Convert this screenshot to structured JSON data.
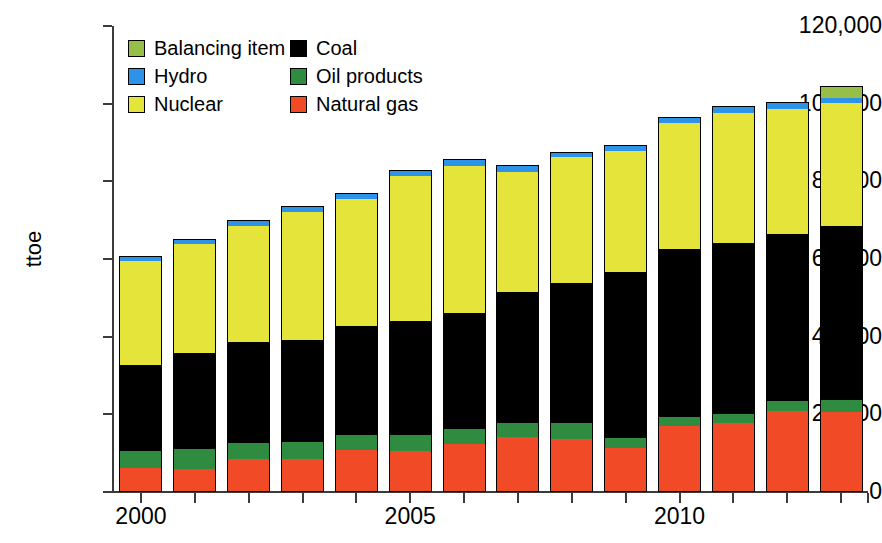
{
  "chart_data": {
    "type": "bar",
    "stacked": true,
    "title": "",
    "xlabel": "",
    "ylabel": "ttoe",
    "ylim": [
      0,
      120000
    ],
    "ytick_values": [
      0,
      20000,
      40000,
      60000,
      80000,
      100000,
      120000
    ],
    "ytick_labels": [
      "0",
      "20,000",
      "40,000",
      "60,000",
      "80,000",
      "100,000",
      "120,000"
    ],
    "grid": false,
    "legend_position": "inside-top-left",
    "categories": [
      2000,
      2001,
      2002,
      2003,
      2004,
      2005,
      2006,
      2007,
      2008,
      2009,
      2010,
      2011,
      2012,
      2013
    ],
    "xtick_labels": [
      "2000",
      "",
      "",
      "",
      "",
      "2005",
      "",
      "",
      "",
      "",
      "2010",
      "",
      "",
      ""
    ],
    "series": [
      {
        "name": "Natural gas",
        "color": "#F04A27",
        "values": [
          6200,
          6000,
          8400,
          8400,
          10700,
          10600,
          12300,
          14200,
          13700,
          11400,
          17000,
          17900,
          20800,
          20600
        ]
      },
      {
        "name": "Oil products",
        "color": "#2E8B40",
        "values": [
          4400,
          5000,
          4300,
          4400,
          4000,
          4100,
          3900,
          3700,
          4100,
          2400,
          2300,
          2200,
          2600,
          3100
        ]
      },
      {
        "name": "Coal",
        "color": "#000000",
        "values": [
          22000,
          24700,
          25900,
          26400,
          28000,
          29400,
          30000,
          33600,
          36000,
          42800,
          43400,
          44100,
          43000,
          44700
        ]
      },
      {
        "name": "Nuclear",
        "color": "#E4E43A",
        "values": [
          26800,
          28100,
          29900,
          33000,
          32800,
          37200,
          37700,
          31000,
          32400,
          31100,
          32200,
          33500,
          32200,
          31800
        ]
      },
      {
        "name": "Hydro",
        "color": "#2C93E8",
        "values": [
          1200,
          1100,
          1300,
          1200,
          1300,
          1400,
          1600,
          1500,
          1200,
          1400,
          1300,
          1400,
          1500,
          1300
        ]
      },
      {
        "name": "Balancing item",
        "color": "#96BE48",
        "values": [
          0,
          0,
          0,
          0,
          0,
          0,
          0,
          0,
          0,
          0,
          0,
          0,
          0,
          2900
        ]
      }
    ],
    "totals": [
      60600,
      64900,
      69800,
      73400,
      76800,
      82700,
      85500,
      84000,
      87400,
      89100,
      96200,
      99100,
      100100,
      104400
    ],
    "legend_entries": [
      {
        "label": "Balancing item",
        "color": "#96BE48"
      },
      {
        "label": "Hydro",
        "color": "#2C93E8"
      },
      {
        "label": "Nuclear",
        "color": "#E4E43A"
      },
      {
        "label": "Coal",
        "color": "#000000"
      },
      {
        "label": "Oil products",
        "color": "#2E8B40"
      },
      {
        "label": "Natural gas",
        "color": "#F04A27"
      }
    ]
  }
}
